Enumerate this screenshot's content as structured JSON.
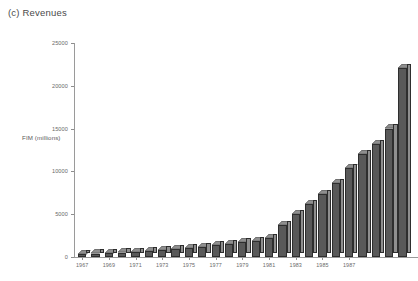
{
  "chart_title": "(c) Revenues",
  "axes": {
    "y_label": "FIM (millions)",
    "y_ticks": [
      "0",
      "5000",
      "10000",
      "15000",
      "20000",
      "25000"
    ],
    "x_ticks": [
      "1967",
      "1969",
      "1971",
      "1973",
      "1975",
      "1977",
      "1979",
      "1981",
      "1983",
      "1985",
      "1987"
    ]
  },
  "colors": {
    "bar_front": "#595959",
    "bar_side": "#8f8f8f",
    "bar_outline": "#2e2e2e",
    "axis": "#9a9a9a",
    "text": "#5a5a5a"
  },
  "chart_data": {
    "type": "bar",
    "title": "(c) Revenues",
    "xlabel": "",
    "ylabel": "FIM (millions)",
    "ylim": [
      0,
      25000
    ],
    "yticks": [
      0,
      5000,
      10000,
      15000,
      20000,
      25000
    ],
    "grid": false,
    "legend": "none",
    "style": "3d-bars",
    "categories": [
      "1967",
      "1968",
      "1969",
      "1970",
      "1971",
      "1972",
      "1973",
      "1974",
      "1975",
      "1976",
      "1977",
      "1978",
      "1979",
      "1980",
      "1981",
      "1982",
      "1983",
      "1984",
      "1985",
      "1986",
      "1987",
      "1988",
      "1989",
      "1990"
    ],
    "values": [
      350,
      400,
      450,
      520,
      600,
      680,
      780,
      900,
      1000,
      1150,
      1350,
      1500,
      1700,
      1900,
      2200,
      3700,
      5000,
      6200,
      7300,
      8600,
      10400,
      12000,
      13200,
      15000
    ],
    "extra_values": [
      22100
    ],
    "values_full": [
      350,
      400,
      450,
      520,
      600,
      680,
      780,
      900,
      1000,
      1150,
      1350,
      1500,
      1700,
      1900,
      2200,
      3700,
      5000,
      6200,
      7300,
      8600,
      10400,
      12000,
      13200,
      15000,
      22100
    ]
  }
}
